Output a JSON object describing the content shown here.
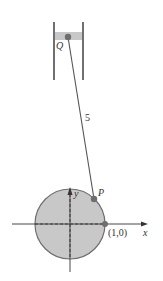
{
  "diagram": {
    "labels": {
      "Q": "Q",
      "P": "P",
      "rod_length": "5",
      "point_1_0": "(1,0)",
      "x_axis": "x",
      "y_axis": "y"
    },
    "colors": {
      "circle_fill": "#c8c8c8",
      "circle_stroke": "#6e6e6e",
      "piston_fill": "#c8c8c8",
      "point_fill": "#6e6e6e",
      "line": "#333333"
    }
  }
}
